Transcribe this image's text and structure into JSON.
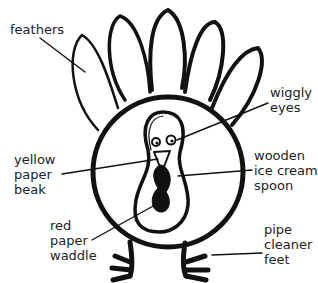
{
  "diagram": {
    "labels": {
      "feathers": "feathers",
      "wiggly_eyes": "wiggly\neyes",
      "yellow_beak": "yellow\npaper\nbeak",
      "spoon": "wooden\nice cream\nspoon",
      "red_waddle": "red\npaper\nwaddle",
      "feet": "pipe\ncleaner\nfeet"
    },
    "colors": {
      "ink": "#111111",
      "text": "#222222",
      "background": "#ffffff"
    }
  }
}
